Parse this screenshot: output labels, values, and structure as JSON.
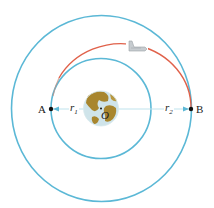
{
  "diagram": {
    "type": "orbital-transfer",
    "labels": {
      "point_a": "A",
      "point_b": "B",
      "center": "O",
      "r1_main": "r",
      "r1_sub": "1",
      "r2_main": "r",
      "r2_sub": "2"
    },
    "colors": {
      "orbit": "#5bb8d6",
      "transfer_arc": "#e0614a",
      "radius_line": "#bfe3ee",
      "point": "#111111",
      "earth_land": "#a8862e",
      "earth_ocean": "#cfe4ea",
      "shuttle": "#a9b0b4"
    },
    "geometry": {
      "center": [
        101,
        108
      ],
      "inner_orbit_radius": 50,
      "outer_orbit_radius": 91,
      "earth_radius": 17
    }
  }
}
